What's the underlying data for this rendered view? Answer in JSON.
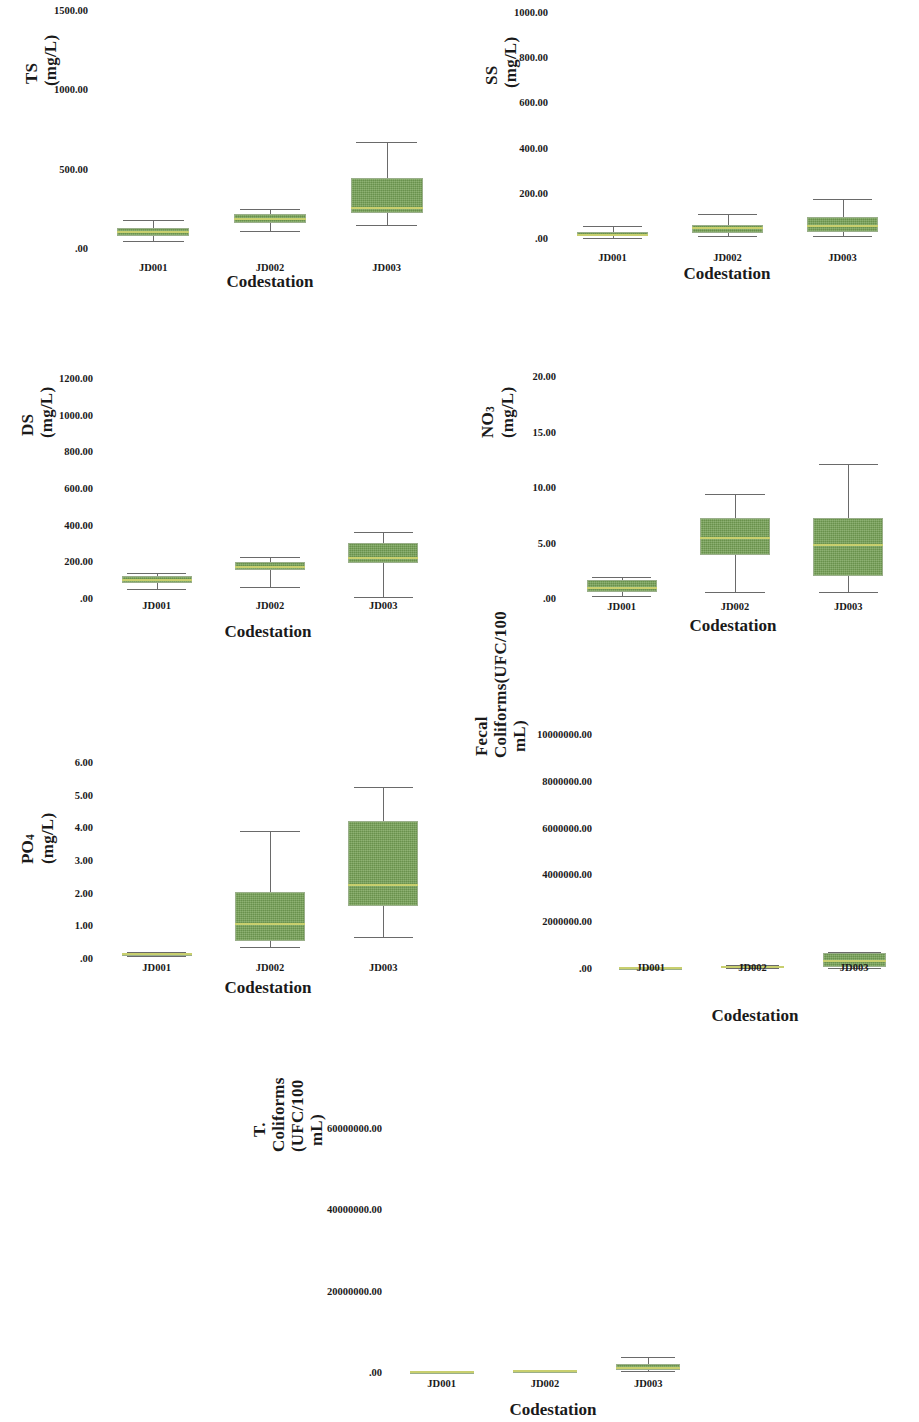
{
  "figure": {
    "categories": [
      "JD001",
      "JD002",
      "JD003"
    ],
    "xlabel": "Codestation",
    "box_color": "#74a054",
    "median_color": "#c8cf6e",
    "whisker_color": "#6a6a6a"
  },
  "chart_data": [
    {
      "type": "box",
      "id": "ts",
      "title": "",
      "ylabel": "TS (mg/L)",
      "ylabel_html": "TS (mg/L)",
      "xlabel": "Codestation",
      "categories": [
        "JD001",
        "JD002",
        "JD003"
      ],
      "yticks": [
        "1500.00",
        "1000.00",
        "500.00",
        ".00"
      ],
      "ytickvals": [
        1500,
        1000,
        500,
        0
      ],
      "ylim": [
        0,
        1500
      ],
      "grid": false,
      "legend": "none",
      "boxes": [
        {
          "category": "JD001",
          "whisker_low": 45,
          "q1": 75,
          "median": 100,
          "q3": 125,
          "whisker_high": 175
        },
        {
          "category": "JD002",
          "whisker_low": 110,
          "q1": 155,
          "median": 185,
          "q3": 215,
          "whisker_high": 245
        },
        {
          "category": "JD003",
          "whisker_low": 145,
          "q1": 220,
          "median": 250,
          "q3": 440,
          "whisker_high": 670
        }
      ]
    },
    {
      "type": "box",
      "id": "ss",
      "title": "",
      "ylabel": "SS (mg/L)",
      "ylabel_html": "SS (mg/L)",
      "xlabel": "Codestation",
      "categories": [
        "JD001",
        "JD002",
        "JD003"
      ],
      "yticks": [
        "1000.00",
        "800.00",
        "600.00",
        "400.00",
        "200.00",
        ".00"
      ],
      "ytickvals": [
        1000,
        800,
        600,
        400,
        200,
        0
      ],
      "ylim": [
        0,
        1000
      ],
      "grid": false,
      "legend": "none",
      "boxes": [
        {
          "category": "JD001",
          "whisker_low": 2,
          "q1": 8,
          "median": 12,
          "q3": 25,
          "whisker_high": 52
        },
        {
          "category": "JD002",
          "whisker_low": 8,
          "q1": 22,
          "median": 45,
          "q3": 58,
          "whisker_high": 105
        },
        {
          "category": "JD003",
          "whisker_low": 10,
          "q1": 25,
          "median": 55,
          "q3": 92,
          "whisker_high": 172
        }
      ]
    },
    {
      "type": "box",
      "id": "ds",
      "title": "",
      "ylabel": "DS (mg/L)",
      "ylabel_html": "DS (mg/L)",
      "xlabel": "Codestation",
      "categories": [
        "JD001",
        "JD002",
        "JD003"
      ],
      "yticks": [
        "1200.00",
        "1000.00",
        "800.00",
        "600.00",
        "400.00",
        "200.00",
        ".00"
      ],
      "ytickvals": [
        1200,
        1000,
        800,
        600,
        400,
        200,
        0
      ],
      "ylim": [
        0,
        1200
      ],
      "grid": false,
      "legend": "none",
      "boxes": [
        {
          "category": "JD001",
          "whisker_low": 50,
          "q1": 82,
          "median": 100,
          "q3": 120,
          "whisker_high": 138
        },
        {
          "category": "JD002",
          "whisker_low": 62,
          "q1": 152,
          "median": 170,
          "q3": 195,
          "whisker_high": 225
        },
        {
          "category": "JD003",
          "whisker_low": 8,
          "q1": 190,
          "median": 220,
          "q3": 298,
          "whisker_high": 360
        }
      ]
    },
    {
      "type": "box",
      "id": "no3",
      "title": "",
      "ylabel": "NO3 (mg/L)",
      "ylabel_html": "NO<sub>3</sub> (mg/L)",
      "xlabel": "Codestation",
      "categories": [
        "JD001",
        "JD002",
        "JD003"
      ],
      "yticks": [
        "20.00",
        "15.00",
        "10.00",
        "5.00",
        ".00"
      ],
      "ytickvals": [
        20,
        15,
        10,
        5,
        0
      ],
      "ylim": [
        0,
        20
      ],
      "grid": false,
      "legend": "none",
      "boxes": [
        {
          "category": "JD001",
          "whisker_low": 0.2,
          "q1": 0.5,
          "median": 0.9,
          "q3": 1.6,
          "whisker_high": 1.9
        },
        {
          "category": "JD002",
          "whisker_low": 0.5,
          "q1": 3.9,
          "median": 5.4,
          "q3": 7.2,
          "whisker_high": 9.4
        },
        {
          "category": "JD003",
          "whisker_low": 0.5,
          "q1": 2.0,
          "median": 4.8,
          "q3": 7.2,
          "whisker_high": 12.1
        }
      ]
    },
    {
      "type": "box",
      "id": "po4",
      "title": "",
      "ylabel": "PO4 (mg/L)",
      "ylabel_html": "PO<sub>4</sub> (mg/L)",
      "xlabel": "Codestation",
      "categories": [
        "JD001",
        "JD002",
        "JD003"
      ],
      "yticks": [
        "6.00",
        "5.00",
        "4.00",
        "3.00",
        "2.00",
        "1.00",
        ".00"
      ],
      "ytickvals": [
        6,
        5,
        4,
        3,
        2,
        1,
        0
      ],
      "ylim": [
        0,
        6
      ],
      "grid": false,
      "legend": "none",
      "boxes": [
        {
          "category": "JD001",
          "whisker_low": 0.05,
          "q1": 0.08,
          "median": 0.11,
          "q3": 0.14,
          "whisker_high": 0.17
        },
        {
          "category": "JD002",
          "whisker_low": 0.35,
          "q1": 0.52,
          "median": 1.05,
          "q3": 2.02,
          "whisker_high": 3.9
        },
        {
          "category": "JD003",
          "whisker_low": 0.65,
          "q1": 1.6,
          "median": 2.25,
          "q3": 4.2,
          "whisker_high": 5.25
        }
      ]
    },
    {
      "type": "box",
      "id": "fecal_coliforms",
      "title": "",
      "ylabel": "Fecal Coliforms(UFC/100 mL)",
      "ylabel_html": "Fecal Coliforms(UFC/100\nmL)",
      "xlabel": "Codestation",
      "categories": [
        "JD001",
        "JD002",
        "JD003"
      ],
      "yticks": [
        "10000000.00",
        "8000000.00",
        "6000000.00",
        "4000000.00",
        "2000000.00",
        ".00"
      ],
      "ytickvals": [
        10000000,
        8000000,
        6000000,
        4000000,
        2000000,
        0
      ],
      "ylim": [
        0,
        10000000
      ],
      "grid": false,
      "legend": "none",
      "boxes": [
        {
          "category": "JD001",
          "whisker_low": 0,
          "q1": 1000,
          "median": 8000,
          "q3": 20000,
          "whisker_high": 40000
        },
        {
          "category": "JD002",
          "whisker_low": 2000,
          "q1": 15000,
          "median": 60000,
          "q3": 90000,
          "whisker_high": 140000
        },
        {
          "category": "JD003",
          "whisker_low": 20000,
          "q1": 60000,
          "median": 300000,
          "q3": 620000,
          "whisker_high": 700000
        }
      ]
    },
    {
      "type": "box",
      "id": "t_coliforms",
      "title": "",
      "ylabel": "T. Coliforms (UFC/100 mL)",
      "ylabel_html": "T. Coliforms (UFC/100\nmL)",
      "xlabel": "Codestation",
      "categories": [
        "JD001",
        "JD002",
        "JD003"
      ],
      "yticks": [
        "60000000.00",
        "40000000.00",
        "20000000.00",
        ".00"
      ],
      "ytickvals": [
        60000000,
        40000000,
        20000000,
        0
      ],
      "ylim": [
        0,
        60000000
      ],
      "grid": false,
      "legend": "none",
      "boxes": [
        {
          "category": "JD001",
          "whisker_low": 0,
          "q1": 20000,
          "median": 60000,
          "q3": 120000,
          "whisker_high": 200000
        },
        {
          "category": "JD002",
          "whisker_low": 30000,
          "q1": 150000,
          "median": 300000,
          "q3": 450000,
          "whisker_high": 600000
        },
        {
          "category": "JD003",
          "whisker_low": 200000,
          "q1": 600000,
          "median": 1100000,
          "q3": 1900000,
          "whisker_high": 3600000
        }
      ]
    }
  ]
}
